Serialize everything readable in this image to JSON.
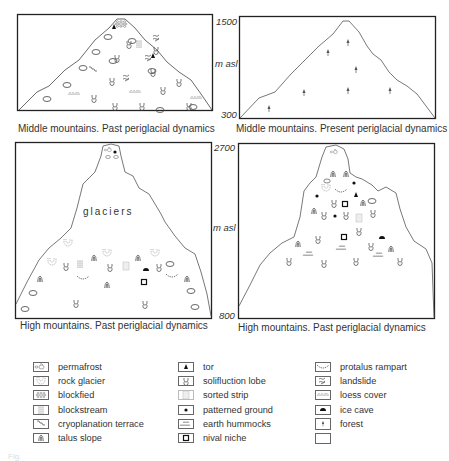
{
  "figure": {
    "panels": [
      {
        "id": "middle-past",
        "caption": "Middle mountains. Past periglacial dynamics",
        "axis": {
          "top": "1500",
          "unit": "m asl",
          "bottom": "300"
        }
      },
      {
        "id": "middle-present",
        "caption": "Middle mountains. Present periglacial dynamics"
      },
      {
        "id": "high-past-1",
        "caption": "High mountains. Past periglacial dynamics",
        "label": "glaciers",
        "axis": {
          "top": "2700",
          "unit": "m asl",
          "bottom": "800"
        }
      },
      {
        "id": "high-past-2",
        "caption": "High mountains. Past periglacial dynamics"
      }
    ],
    "legend": {
      "columns": [
        [
          {
            "symbol": "permafrost-icon",
            "label": "permafrost"
          },
          {
            "symbol": "rock-glacier-icon",
            "label": "rock glacier"
          },
          {
            "symbol": "blockfield-icon",
            "label": "blockfied"
          },
          {
            "symbol": "blockstream-icon",
            "label": "blockstream"
          },
          {
            "symbol": "cryoplanation-terrace-icon",
            "label": "cryoplanation terrace"
          },
          {
            "symbol": "talus-slope-icon",
            "label": "talus slope"
          }
        ],
        [
          {
            "symbol": "tor-icon",
            "label": "tor"
          },
          {
            "symbol": "solifluction-lobe-icon",
            "label": "solifluction lobe"
          },
          {
            "symbol": "sorted-strip-icon",
            "label": "sorted strip"
          },
          {
            "symbol": "patterned-ground-icon",
            "label": "patterned ground"
          },
          {
            "symbol": "earth-hummocks-icon",
            "label": "earth hummocks"
          },
          {
            "symbol": "nival-niche-icon",
            "label": "nival niche"
          }
        ],
        [
          {
            "symbol": "protalus-rampart-icon",
            "label": "protalus rampart"
          },
          {
            "symbol": "landslide-icon",
            "label": "landslide"
          },
          {
            "symbol": "loess-cover-icon",
            "label": "loess cover"
          },
          {
            "symbol": "ice-cave-icon",
            "label": "ice cave"
          },
          {
            "symbol": "forest-icon",
            "label": "forest"
          },
          {
            "symbol": "empty-icon",
            "label": ""
          }
        ]
      ]
    },
    "fig_label": "Fig."
  }
}
